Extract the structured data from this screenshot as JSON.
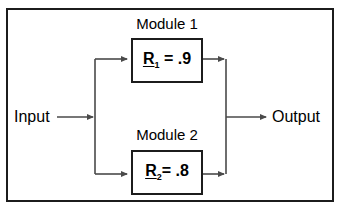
{
  "diagram": {
    "colors": {
      "border": "#1c1c1c",
      "line": "#555555",
      "background": "#ffffff",
      "text": "#000000"
    },
    "input": {
      "label": "Input"
    },
    "output": {
      "label": "Output"
    },
    "modules": [
      {
        "label": "Module 1",
        "symbol": "R",
        "subscript": "1",
        "operator": "=",
        "value": ".9"
      },
      {
        "label": "Module 2",
        "symbol": "R",
        "subscript": "2",
        "operator": "=",
        "value": ".8"
      }
    ],
    "connectors": {
      "input_arrow": "arrow-right",
      "split_node": "split-junction",
      "merge_node": "merge-junction",
      "output_arrow": "arrow-right"
    }
  }
}
